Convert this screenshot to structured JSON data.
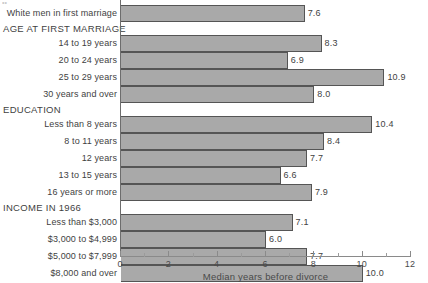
{
  "chart_data": {
    "type": "bar",
    "orientation": "horizontal",
    "title": "",
    "xlabel": "Median years before divorce",
    "ylabel": "",
    "xlim": [
      0,
      12
    ],
    "xticks": [
      0,
      2,
      4,
      6,
      8,
      10,
      12
    ],
    "xtick_labels": [
      "0",
      "2",
      "4",
      "6",
      "8",
      "10",
      "12"
    ],
    "minor_xticks": [
      1,
      3,
      5,
      7,
      9,
      11
    ],
    "grid": false,
    "legend": "none",
    "value_label_format": "one-decimal",
    "groups": [
      {
        "name": "",
        "header": "",
        "rows": [
          {
            "label": "White men in first marriage",
            "value": 7.6,
            "value_label": "7.6"
          }
        ]
      },
      {
        "name": "AGE AT FIRST MARRIAGE",
        "header": "AGE AT FIRST MARRIAGE",
        "rows": [
          {
            "label": "14 to 19 years",
            "value": 8.3,
            "value_label": "8.3"
          },
          {
            "label": "20 to 24 years",
            "value": 6.9,
            "value_label": "6.9"
          },
          {
            "label": "25 to 29 years",
            "value": 10.9,
            "value_label": "10.9"
          },
          {
            "label": "30 years and over",
            "value": 8.0,
            "value_label": "8.0"
          }
        ]
      },
      {
        "name": "EDUCATION",
        "header": "EDUCATION",
        "rows": [
          {
            "label": "Less than 8 years",
            "value": 10.4,
            "value_label": "10.4"
          },
          {
            "label": "8 to 11 years",
            "value": 8.4,
            "value_label": "8.4"
          },
          {
            "label": "12 years",
            "value": 7.7,
            "value_label": "7.7"
          },
          {
            "label": "13 to 15 years",
            "value": 6.6,
            "value_label": "6.6"
          },
          {
            "label": "16 years or more",
            "value": 7.9,
            "value_label": "7.9"
          }
        ]
      },
      {
        "name": "INCOME IN 1966",
        "header": "INCOME IN 1966",
        "rows": [
          {
            "label": "Less than $3,000",
            "value": 7.1,
            "value_label": "7.1"
          },
          {
            "label": "$3,000 to $4,999",
            "value": 6.0,
            "value_label": "6.0"
          },
          {
            "label": "$5,000 to $7,999",
            "value": 7.7,
            "value_label": "7.7"
          },
          {
            "label": "$8,000 and over",
            "value": 10.0,
            "value_label": "10.0"
          }
        ]
      }
    ],
    "colors": {
      "bar_fill": "#a9a9a9",
      "bar_stroke": "#555555",
      "axis": "#8a8a8a",
      "text": "#3f3f3f",
      "background": "#ffffff"
    }
  }
}
